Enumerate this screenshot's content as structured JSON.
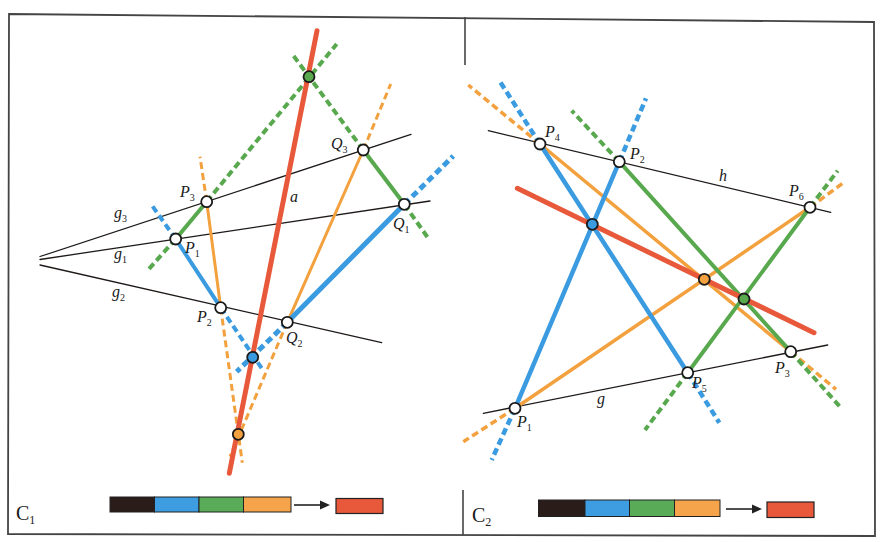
{
  "colors": {
    "black": "#1e1a18",
    "blue": "#3b9be0",
    "green": "#58a84e",
    "orange": "#f3a13e",
    "red": "#e8583a",
    "point_stroke": "#1a1a1a",
    "white": "#ffffff",
    "frame": "#444444",
    "legend_black": "#2a1c18",
    "legend_blue": "#3d9de0",
    "legend_green": "#5aab58",
    "legend_orange": "#f5a44c",
    "legend_red": "#e8583a"
  },
  "style": {
    "dash": "7 4",
    "point_radius": 5.5,
    "point_stroke_width": 1.8,
    "label_size": 16,
    "sub_size": 10
  },
  "frame": {
    "outline": [
      [
        9,
        14
      ],
      [
        874,
        22
      ],
      [
        875,
        536
      ],
      [
        8,
        534
      ]
    ],
    "dividers": [
      [
        [
          465,
          17
        ],
        [
          465,
          65
        ]
      ],
      [
        [
          463,
          490
        ],
        [
          463,
          535
        ]
      ]
    ]
  },
  "panels": [
    {
      "id": "C1",
      "label": {
        "main": "C",
        "sub": "1",
        "x": 16,
        "y": 520
      },
      "lines": [
        {
          "name": "g3",
          "color": "black",
          "width": 1.3,
          "solid": [
            [
              40,
              256.5
            ],
            [
              411,
              134.3
            ]
          ],
          "dashed": []
        },
        {
          "name": "g1",
          "color": "black",
          "width": 1.3,
          "solid": [
            [
              40,
              259.5
            ],
            [
              430,
              201
            ]
          ],
          "dashed": []
        },
        {
          "name": "g2",
          "color": "black",
          "width": 1.3,
          "solid": [
            [
              40,
              265
            ],
            [
              381.7,
              342.7
            ]
          ],
          "dashed": []
        },
        {
          "name": "orange-p3-p2",
          "color": "orange",
          "width": 3,
          "solid": [
            [
              206.7,
              201.7
            ],
            [
              220.7,
              307.7
            ]
          ],
          "dashed": [
            [
              [
                206.7,
                201.7
              ],
              [
                200,
                156.7
              ]
            ],
            [
              [
                220.7,
                307.7
              ],
              [
                242.3,
                462.7
              ]
            ]
          ]
        },
        {
          "name": "orange-q3-q2",
          "color": "orange",
          "width": 3,
          "solid": [
            [
              363.3,
              150
            ],
            [
              287.3,
              322.3
            ]
          ],
          "dashed": [
            [
              [
                363.3,
                150
              ],
              [
                390.7,
                84
              ]
            ],
            [
              [
                287.3,
                322.3
              ],
              [
                230,
                456.7
              ]
            ]
          ]
        },
        {
          "name": "green-p1-p3",
          "color": "green",
          "width": 4,
          "solid": [
            [
              175.7,
              239
            ],
            [
              206.7,
              201.7
            ]
          ],
          "dashed": [
            [
              [
                206.7,
                201.7
              ],
              [
                336.7,
                44
              ]
            ],
            [
              [
                175.7,
                239
              ],
              [
                148,
                270
              ]
            ]
          ]
        },
        {
          "name": "green-q3-q1",
          "color": "green",
          "width": 4,
          "solid": [
            [
              363.3,
              150
            ],
            [
              404.3,
              204.3
            ]
          ],
          "dashed": [
            [
              [
                363.3,
                150
              ],
              [
                291.7,
                53.3
              ]
            ],
            [
              [
                404.3,
                204.3
              ],
              [
                428.3,
                238.3
              ]
            ]
          ]
        },
        {
          "name": "blue-p1-p2",
          "color": "blue",
          "width": 4,
          "solid": [
            [
              175.7,
              239
            ],
            [
              220.7,
              307.7
            ]
          ],
          "dashed": [
            [
              [
                175.7,
                239
              ],
              [
                151.7,
                205
              ]
            ],
            [
              [
                220.7,
                307.7
              ],
              [
                261.7,
                368.3
              ]
            ]
          ]
        },
        {
          "name": "blue-q2-q1",
          "color": "blue",
          "width": 5,
          "solid": [
            [
              287.3,
              322.3
            ],
            [
              404.3,
              204.3
            ]
          ],
          "dashed": [
            [
              [
                404.3,
                204.3
              ],
              [
                453.3,
                156
              ]
            ],
            [
              [
                287.3,
                322.3
              ],
              [
                236.7,
                371.7
              ]
            ]
          ]
        },
        {
          "name": "red-a",
          "color": "red",
          "width": 5,
          "solid": [
            [
              317,
              30.7
            ],
            [
              229.3,
              473.3
            ]
          ],
          "dashed": []
        }
      ],
      "points": [
        {
          "name": "P1",
          "x": 175.7,
          "y": 239,
          "fill": "white"
        },
        {
          "name": "P2",
          "x": 220.7,
          "y": 307.7,
          "fill": "white"
        },
        {
          "name": "P3",
          "x": 206.7,
          "y": 201.7,
          "fill": "white"
        },
        {
          "name": "Q1",
          "x": 404.3,
          "y": 204.3,
          "fill": "white"
        },
        {
          "name": "Q2",
          "x": 287.3,
          "y": 322.3,
          "fill": "white"
        },
        {
          "name": "Q3",
          "x": 363.3,
          "y": 150,
          "fill": "white"
        },
        {
          "name": "green-intersection",
          "x": 309,
          "y": 76.7,
          "fill": "green"
        },
        {
          "name": "blue-intersection",
          "x": 252.7,
          "y": 357.3,
          "fill": "blue"
        },
        {
          "name": "orange-intersection",
          "x": 238.3,
          "y": 434.3,
          "fill": "orange"
        }
      ],
      "labels": [
        {
          "main": "P",
          "sub": "3",
          "x": 180,
          "y": 197
        },
        {
          "main": "P",
          "sub": "1",
          "x": 185,
          "y": 253
        },
        {
          "main": "P",
          "sub": "2",
          "x": 197,
          "y": 322
        },
        {
          "main": "Q",
          "sub": "3",
          "x": 331,
          "y": 149
        },
        {
          "main": "Q",
          "sub": "1",
          "x": 393,
          "y": 229
        },
        {
          "main": "Q",
          "sub": "2",
          "x": 286,
          "y": 343
        },
        {
          "main": "a",
          "sub": "",
          "x": 290,
          "y": 202
        },
        {
          "main": "g",
          "sub": "3",
          "x": 114,
          "y": 218
        },
        {
          "main": "g",
          "sub": "1",
          "x": 114,
          "y": 259
        },
        {
          "main": "g",
          "sub": "2",
          "x": 112,
          "y": 297
        }
      ],
      "legend": {
        "bar": {
          "x": 110,
          "y": 497,
          "h": 15,
          "segments": [
            {
              "color": "legend_black",
              "w": 44.5
            },
            {
              "color": "legend_blue",
              "w": 44.5
            },
            {
              "color": "legend_green",
              "w": 44.5
            },
            {
              "color": "legend_orange",
              "w": 47.5
            }
          ]
        },
        "arrow": {
          "x1": 294,
          "x2": 330,
          "y": 505
        },
        "result": {
          "x": 336,
          "y": 498.5,
          "w": 47,
          "h": 15,
          "color": "legend_red"
        }
      }
    },
    {
      "id": "C2",
      "label": {
        "main": "C",
        "sub": "2",
        "x": 472,
        "y": 522
      },
      "lines": [
        {
          "name": "h",
          "color": "black",
          "width": 1.3,
          "solid": [
            [
              488.3,
              130.7
            ],
            [
              830.7,
              212.3
            ]
          ],
          "dashed": []
        },
        {
          "name": "g",
          "color": "black",
          "width": 1.3,
          "solid": [
            [
              483.3,
              413.3
            ],
            [
              827.7,
              345
            ]
          ],
          "dashed": []
        },
        {
          "name": "orange-p1-p6",
          "color": "orange",
          "width": 3.5,
          "solid": [
            [
              515,
              408.3
            ],
            [
              810,
              207.3
            ]
          ],
          "dashed": [
            [
              [
                515,
                408.3
              ],
              [
                463.3,
                441.7
              ]
            ],
            [
              [
                810,
                207.3
              ],
              [
                842.7,
                183.3
              ]
            ]
          ]
        },
        {
          "name": "orange-p4-p3",
          "color": "orange",
          "width": 3.5,
          "solid": [
            [
              540,
              144
            ],
            [
              790.7,
              351.7
            ]
          ],
          "dashed": [
            [
              [
                540,
                144
              ],
              [
                468.3,
                85
              ]
            ],
            [
              [
                790.7,
                351.7
              ],
              [
                836,
                389.3
              ]
            ]
          ]
        },
        {
          "name": "green-p2-p3",
          "color": "green",
          "width": 4,
          "solid": [
            [
              619.3,
              161.7
            ],
            [
              790.7,
              351.7
            ]
          ],
          "dashed": [
            [
              [
                619.3,
                161.7
              ],
              [
                571.7,
                110.7
              ]
            ],
            [
              [
                790.7,
                351.7
              ],
              [
                840,
                406.7
              ]
            ]
          ]
        },
        {
          "name": "green-p5-p6",
          "color": "green",
          "width": 4,
          "solid": [
            [
              687.7,
              372.7
            ],
            [
              810,
              207.3
            ]
          ],
          "dashed": [
            [
              [
                810,
                207.3
              ],
              [
                837.7,
                170.7
              ]
            ],
            [
              [
                687.7,
                372.7
              ],
              [
                645,
                430
              ]
            ]
          ]
        },
        {
          "name": "blue-p1-p2",
          "color": "blue",
          "width": 4.5,
          "solid": [
            [
              515,
              408.3
            ],
            [
              619.3,
              161.7
            ]
          ],
          "dashed": [
            [
              [
                619.3,
                161.7
              ],
              [
                646,
                98.3
              ]
            ],
            [
              [
                515,
                408.3
              ],
              [
                491.7,
                460
              ]
            ]
          ]
        },
        {
          "name": "blue-p4-p5",
          "color": "blue",
          "width": 4.5,
          "solid": [
            [
              540,
              144
            ],
            [
              687.7,
              372.7
            ]
          ],
          "dashed": [
            [
              [
                540,
                144
              ],
              [
                500,
                81.7
              ]
            ],
            [
              [
                687.7,
                372.7
              ],
              [
                719.3,
                422.7
              ]
            ]
          ]
        },
        {
          "name": "red-line",
          "color": "red",
          "width": 5,
          "solid": [
            [
              517.3,
              188.3
            ],
            [
              814,
              332.7
            ]
          ],
          "dashed": []
        }
      ],
      "points": [
        {
          "name": "P1",
          "x": 515,
          "y": 408.3,
          "fill": "white"
        },
        {
          "name": "P2",
          "x": 619.3,
          "y": 161.7,
          "fill": "white"
        },
        {
          "name": "P3",
          "x": 790.7,
          "y": 351.7,
          "fill": "white"
        },
        {
          "name": "P4",
          "x": 540,
          "y": 144,
          "fill": "white"
        },
        {
          "name": "P5",
          "x": 687.7,
          "y": 372.7,
          "fill": "white"
        },
        {
          "name": "P6",
          "x": 810,
          "y": 207.3,
          "fill": "white"
        },
        {
          "name": "blue-intersection",
          "x": 592.3,
          "y": 224.3,
          "fill": "blue"
        },
        {
          "name": "orange-intersection",
          "x": 704.3,
          "y": 279.3,
          "fill": "orange"
        },
        {
          "name": "green-intersection",
          "x": 744,
          "y": 299,
          "fill": "green"
        }
      ],
      "labels": [
        {
          "main": "P",
          "sub": "4",
          "x": 545,
          "y": 137
        },
        {
          "main": "P",
          "sub": "2",
          "x": 630,
          "y": 159
        },
        {
          "main": "h",
          "sub": "",
          "x": 719,
          "y": 181
        },
        {
          "main": "P",
          "sub": "6",
          "x": 789,
          "y": 196
        },
        {
          "main": "P",
          "sub": "3",
          "x": 775,
          "y": 373
        },
        {
          "main": "P",
          "sub": "5",
          "x": 692,
          "y": 388
        },
        {
          "main": "P",
          "sub": "1",
          "x": 517,
          "y": 427
        },
        {
          "main": "g",
          "sub": "",
          "x": 597,
          "y": 404
        }
      ],
      "legend": {
        "bar": {
          "x": 538.5,
          "y": 500,
          "h": 16.5,
          "segments": [
            {
              "color": "legend_black",
              "w": 46.5
            },
            {
              "color": "legend_blue",
              "w": 44.5
            },
            {
              "color": "legend_green",
              "w": 45
            },
            {
              "color": "legend_orange",
              "w": 45.5
            }
          ]
        },
        "arrow": {
          "x1": 726,
          "x2": 762,
          "y": 509
        },
        "result": {
          "x": 767,
          "y": 502,
          "w": 47,
          "h": 15.5,
          "color": "legend_red"
        }
      }
    }
  ]
}
